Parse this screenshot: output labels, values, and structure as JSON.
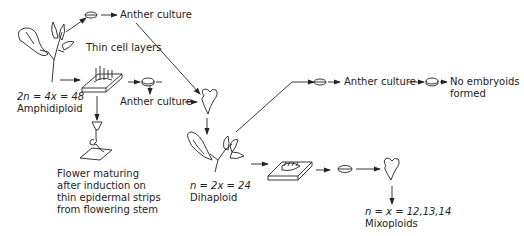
{
  "labels": {
    "anther_culture_top": "Anther culture",
    "thin_cell_layers": "Thin cell layers",
    "amphidiploid_formula": "2n = 4x = 48",
    "amphidiploid_name": "Amphidiploid",
    "anther_culture_mid": "Anther culture",
    "flower_maturing": [
      "Flower maturing",
      "after induction on",
      "thin epidermal strips",
      "from flowering stem"
    ],
    "dihaploid_formula": "n = 2x = 24",
    "dihaploid_name": "Dihaploid",
    "anther_culture_right": "Anther culture",
    "no_embryoids": [
      "No embryoids",
      "formed"
    ],
    "mixoploid_formula": "n = x = 12,13,14",
    "mixoploid_name": "Mixoploids"
  },
  "nodes": [
    {
      "id": "amphidiploid-plant",
      "icon": "flowering-plant"
    },
    {
      "id": "anther-dish-top",
      "icon": "petri-dish"
    },
    {
      "id": "thin-cell-layer-dish",
      "icon": "culture-slab"
    },
    {
      "id": "anther-dish-mid",
      "icon": "petri-dish"
    },
    {
      "id": "embryoid-1",
      "icon": "heart-embryoid"
    },
    {
      "id": "flower-on-strip",
      "icon": "flower-on-slab"
    },
    {
      "id": "dihaploid-plant",
      "icon": "flowering-plant"
    },
    {
      "id": "anther-dish-right",
      "icon": "petri-dish"
    },
    {
      "id": "anther-dish-right-2",
      "icon": "petri-dish"
    },
    {
      "id": "dihaploid-slab",
      "icon": "culture-slab"
    },
    {
      "id": "dish-bottom",
      "icon": "petri-dish"
    },
    {
      "id": "embryoid-2",
      "icon": "heart-embryoid"
    }
  ]
}
